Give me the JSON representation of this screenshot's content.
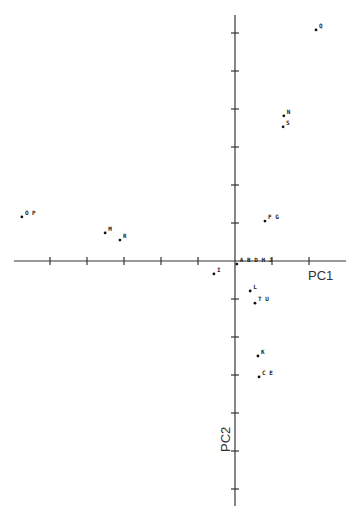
{
  "chart_data": {
    "type": "scatter",
    "title": "",
    "xlabel": "PC1",
    "ylabel": "PC2",
    "grid": false,
    "legend": null,
    "xlim": [
      -6,
      3
    ],
    "ylim": [
      -6.5,
      6.5
    ],
    "x_tick_step": 1,
    "y_tick_step": 1,
    "tick_labels_shown": false,
    "points": [
      {
        "label": "O P",
        "x": -5.76,
        "y": 1.16
      },
      {
        "label": "M",
        "x": -3.51,
        "y": 0.74
      },
      {
        "label": "R",
        "x": -3.11,
        "y": 0.55
      },
      {
        "label": "I",
        "x": -0.57,
        "y": -0.34
      },
      {
        "label": "A B D H J",
        "x": 0.05,
        "y": -0.08
      },
      {
        "label": "F G",
        "x": 0.81,
        "y": 1.05
      },
      {
        "label": "L",
        "x": 0.41,
        "y": -0.79
      },
      {
        "label": "T U",
        "x": 0.54,
        "y": -1.11
      },
      {
        "label": "K",
        "x": 0.62,
        "y": -2.5
      },
      {
        "label": "C E",
        "x": 0.65,
        "y": -3.05
      },
      {
        "label": "N",
        "x": 1.32,
        "y": 3.82
      },
      {
        "label": "S",
        "x": 1.3,
        "y": 3.53
      },
      {
        "label": "Q",
        "x": 2.19,
        "y": 6.08
      }
    ]
  },
  "layout": {
    "origin_px": [
      235,
      261
    ],
    "x_unit_px": 37,
    "y_unit_px": 38,
    "x_axis_px": [
      14,
      346
    ],
    "y_axis_px": [
      15,
      506
    ],
    "x_ticks": [
      -5,
      -4,
      -3,
      -2,
      -1,
      1,
      2
    ],
    "y_ticks": [
      -6,
      -5,
      -4,
      -3,
      -2,
      -1,
      1,
      2,
      3,
      4,
      5,
      6
    ]
  },
  "colors": {
    "axis": "#333333",
    "point": "#111111",
    "text": "#222222"
  }
}
